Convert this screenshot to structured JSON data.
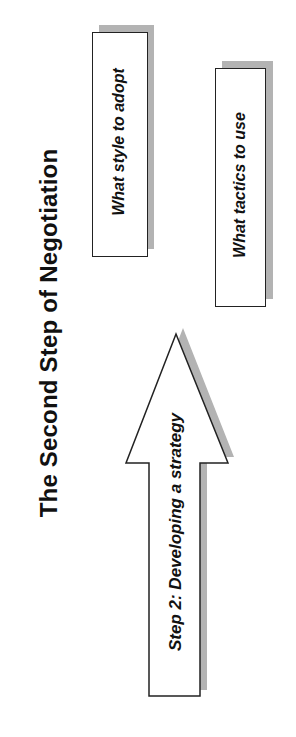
{
  "slide": {
    "title": "The Second Step of Negotiation",
    "orientation": "rotated -90deg (landscape slide shown in portrait)"
  },
  "diagram": {
    "arrow": {
      "label": "Step 2:  Developing a strategy",
      "direction": "up"
    },
    "boxes": [
      {
        "label": "What style to adopt"
      },
      {
        "label": "What tactics to use"
      }
    ]
  },
  "colors": {
    "background": "#ffffff",
    "stroke": "#222222",
    "shadow": "#b3b3b3",
    "text": "#111111"
  }
}
